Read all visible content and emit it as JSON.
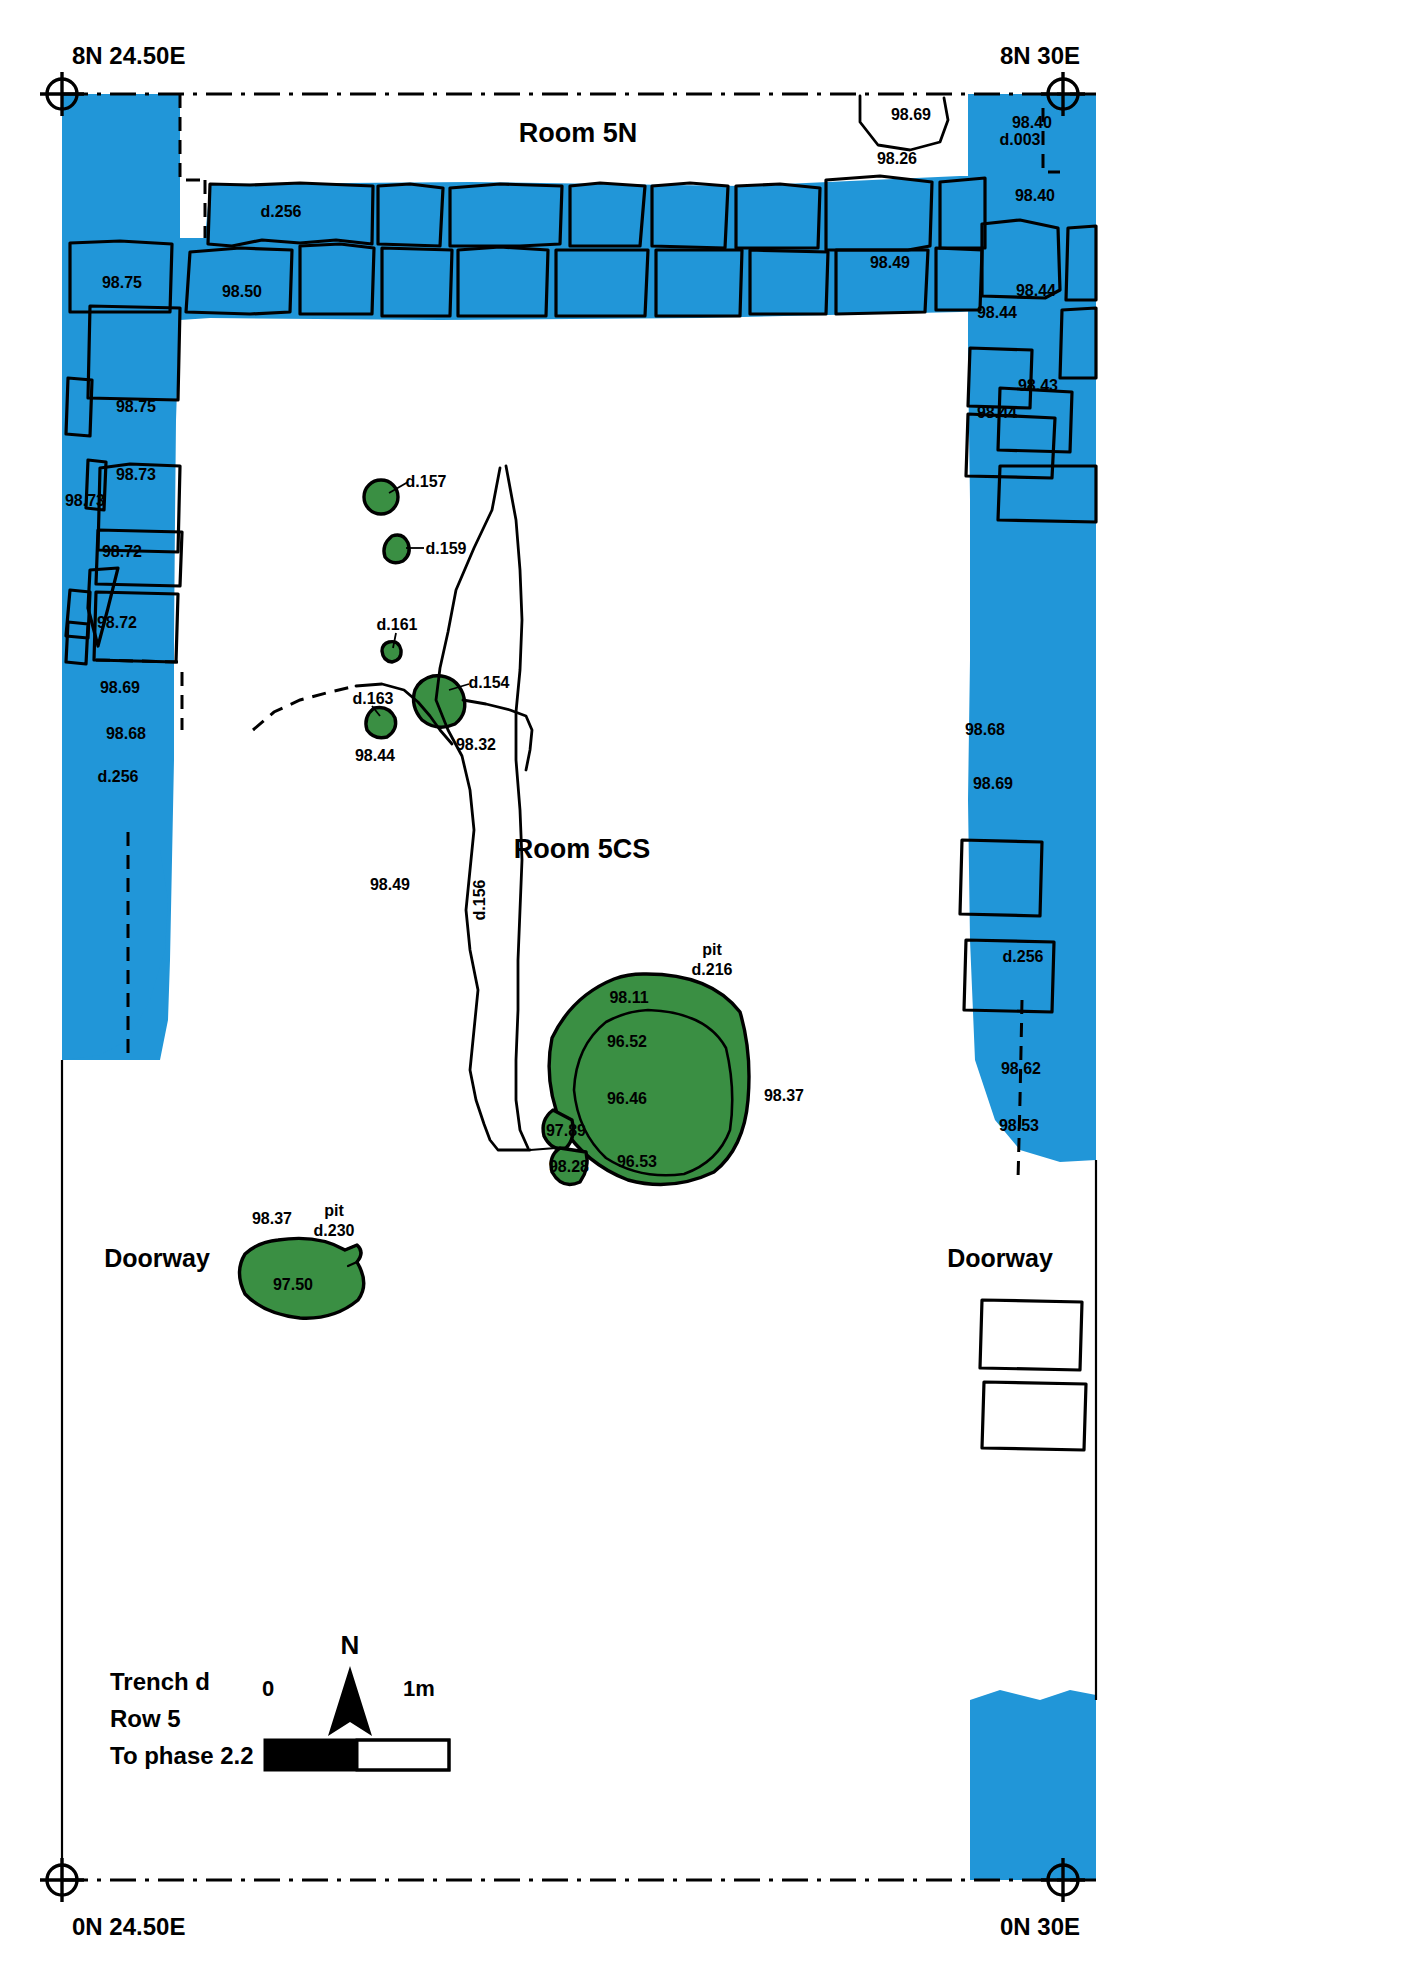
{
  "plan": {
    "title_block": {
      "line1": "Trench d",
      "line2": "Row 5",
      "line3": "To phase 2.2"
    },
    "scale_bar": {
      "zero": "0",
      "max": "1m"
    },
    "north_arrow": {
      "letter": "N"
    },
    "grid_corners": [
      {
        "name": "top-left",
        "label": "8N 24.50E"
      },
      {
        "name": "top-right",
        "label": "8N 30E"
      },
      {
        "name": "bottom-left",
        "label": "0N 24.50E"
      },
      {
        "name": "bottom-right",
        "label": "0N 30E"
      }
    ],
    "rooms": [
      {
        "name": "room-5n",
        "label": "Room 5N"
      },
      {
        "name": "room-5cs",
        "label": "Room 5CS"
      }
    ],
    "doorways": [
      {
        "name": "doorway-west",
        "label": "Doorway"
      },
      {
        "name": "doorway-east",
        "label": "Doorway"
      }
    ],
    "elevations": [
      {
        "id": "e01",
        "value": "98.69"
      },
      {
        "id": "e02",
        "value": "98.40"
      },
      {
        "id": "e03",
        "value": "98.26"
      },
      {
        "id": "e04",
        "value": "98.40"
      },
      {
        "id": "e05",
        "value": "98.75"
      },
      {
        "id": "e06",
        "value": "98.50"
      },
      {
        "id": "e07",
        "value": "98.49"
      },
      {
        "id": "e08",
        "value": "98.44"
      },
      {
        "id": "e09",
        "value": "98.44"
      },
      {
        "id": "e10",
        "value": "98.75"
      },
      {
        "id": "e11",
        "value": "98.43"
      },
      {
        "id": "e12",
        "value": "98.44"
      },
      {
        "id": "e13",
        "value": "98.73"
      },
      {
        "id": "e14",
        "value": "98.73"
      },
      {
        "id": "e15",
        "value": "98.72"
      },
      {
        "id": "e16",
        "value": "98.72"
      },
      {
        "id": "e17",
        "value": "98.69"
      },
      {
        "id": "e18",
        "value": "98.68"
      },
      {
        "id": "e19",
        "value": "98.68"
      },
      {
        "id": "e20",
        "value": "98.69"
      },
      {
        "id": "e21",
        "value": "98.44"
      },
      {
        "id": "e22",
        "value": "98.32"
      },
      {
        "id": "e23",
        "value": "98.49"
      },
      {
        "id": "e24",
        "value": "98.11"
      },
      {
        "id": "e25",
        "value": "96.52"
      },
      {
        "id": "e26",
        "value": "96.46"
      },
      {
        "id": "e27",
        "value": "96.53"
      },
      {
        "id": "e28",
        "value": "98.37"
      },
      {
        "id": "e29",
        "value": "97.89"
      },
      {
        "id": "e30",
        "value": "98.28"
      },
      {
        "id": "e31",
        "value": "98.62"
      },
      {
        "id": "e32",
        "value": "98.53"
      },
      {
        "id": "e33",
        "value": "98.37"
      },
      {
        "id": "e34",
        "value": "97.50"
      }
    ],
    "contexts": [
      {
        "id": "c01",
        "value": "d.256"
      },
      {
        "id": "c02",
        "value": "d.003"
      },
      {
        "id": "c03",
        "value": "d.157"
      },
      {
        "id": "c04",
        "value": "d.159"
      },
      {
        "id": "c05",
        "value": "d.161"
      },
      {
        "id": "c06",
        "value": "d.163"
      },
      {
        "id": "c07",
        "value": "d.154"
      },
      {
        "id": "c08",
        "value": "d.156"
      },
      {
        "id": "c09",
        "value": "d.256"
      },
      {
        "id": "c10",
        "value": "d.256"
      }
    ],
    "pits": [
      {
        "id": "p01",
        "kind": "pit",
        "number": "d.216"
      },
      {
        "id": "p02",
        "kind": "pit",
        "number": "d.230"
      }
    ],
    "colors": {
      "wall": "#2196d8",
      "feature": "#3a8f43",
      "ink": "#000000",
      "background": "#ffffff"
    }
  }
}
